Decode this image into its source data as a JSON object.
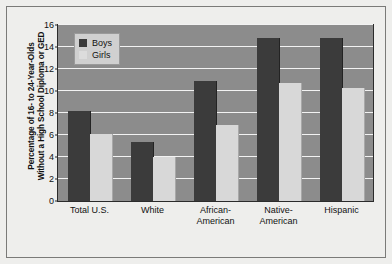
{
  "chart_data": {
    "type": "bar",
    "title": "",
    "xlabel": "",
    "ylabel_line1": "Percentage of 16- to 24-Year-Olds",
    "ylabel_line2": "Without a High School Diploma or GED",
    "categories": [
      "Total U.S.",
      "White",
      "African-\nAmerican",
      "Native-\nAmerican",
      "Hispanic"
    ],
    "category_lines": [
      [
        "Total U.S."
      ],
      [
        "White"
      ],
      [
        "African-",
        "American"
      ],
      [
        "Native-",
        "American"
      ],
      [
        "Hispanic"
      ]
    ],
    "series": [
      {
        "name": "Boys",
        "color": "#3b3b3b",
        "values": [
          8.2,
          5.4,
          10.9,
          14.8,
          14.8
        ]
      },
      {
        "name": "Girls",
        "color": "#d8d8d8",
        "values": [
          6.1,
          4.0,
          6.9,
          10.7,
          10.3
        ]
      }
    ],
    "ylim": [
      0,
      16
    ],
    "yticks": [
      0,
      2,
      4,
      6,
      8,
      10,
      12,
      14,
      16
    ],
    "ytick_labels": [
      "0",
      "2",
      "4",
      "6",
      "8",
      "10",
      "12",
      "14",
      "16"
    ],
    "grid": true,
    "legend_position": "top-left",
    "plot_background": "#8c8c8c",
    "gridline_color": "#f2f2f2",
    "figure_background": "#eeeeec"
  }
}
